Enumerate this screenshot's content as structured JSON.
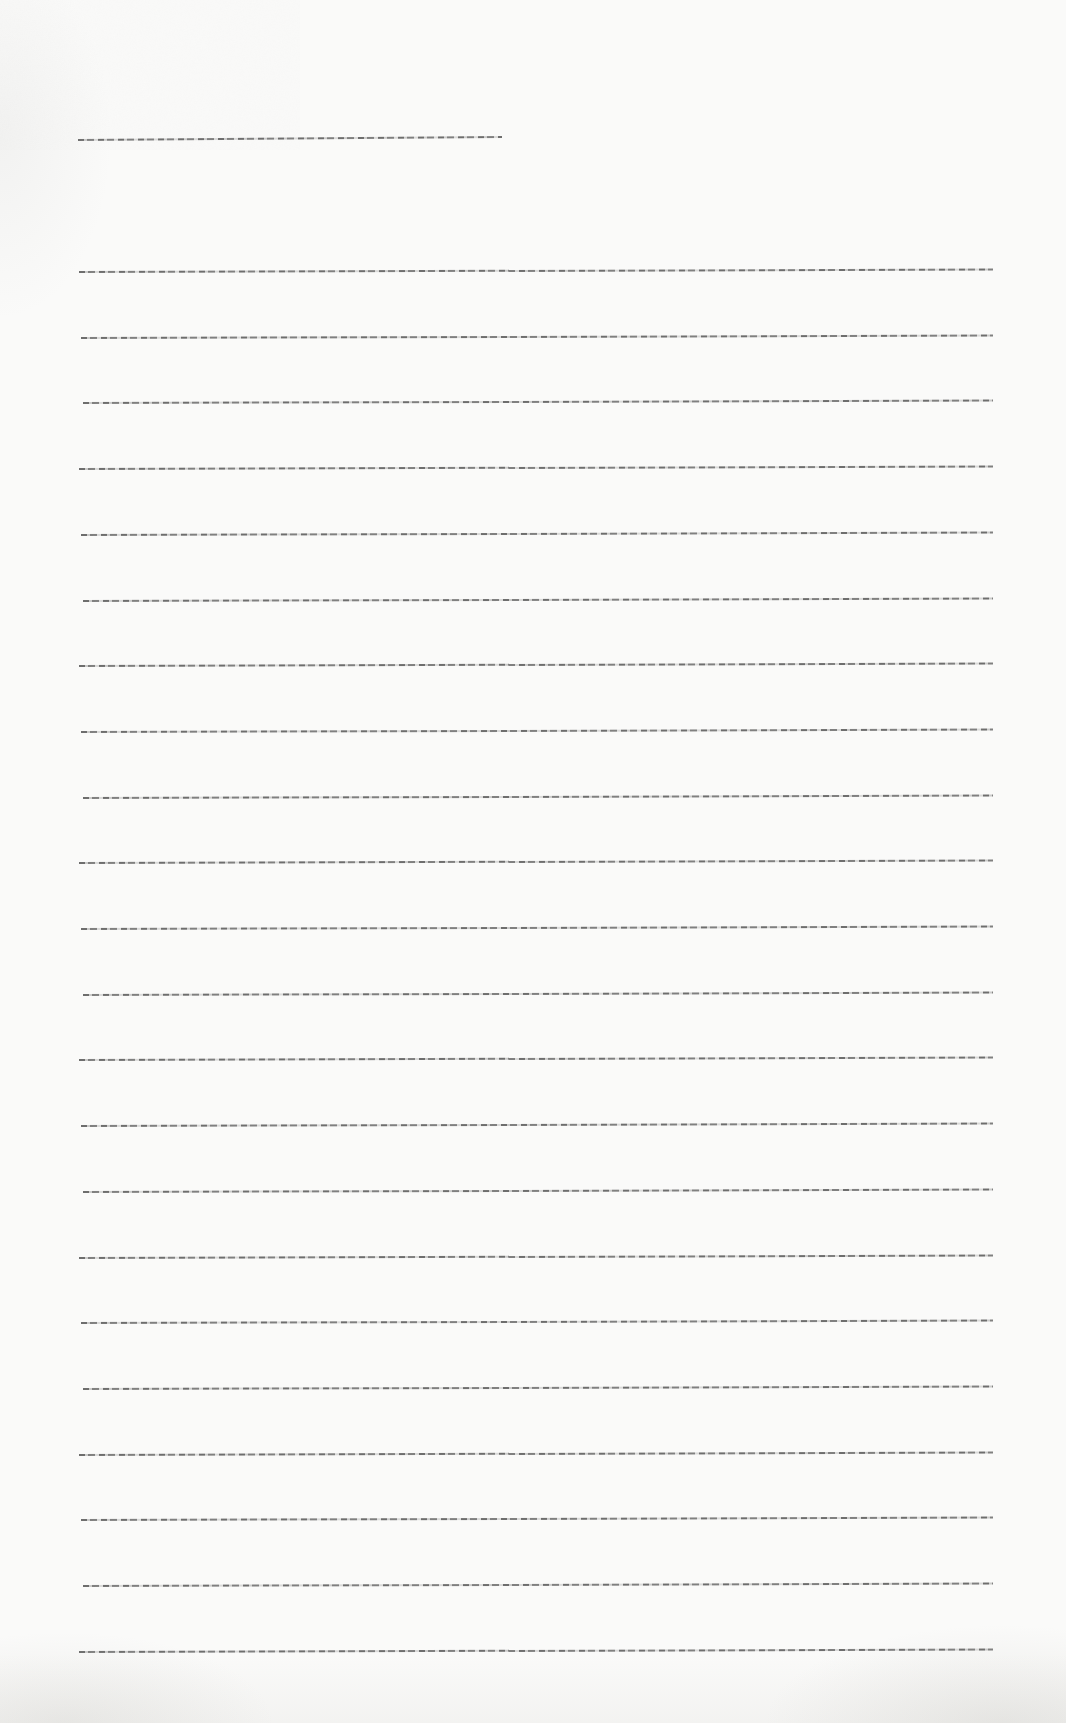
{
  "page": {
    "width": 1066,
    "height": 1723,
    "background_color": "#fafaf9",
    "content": "blank-ruled-notebook-page",
    "text_content": ""
  },
  "title_line": {
    "x": 78,
    "y": 139,
    "width": 424,
    "tilt_deg": -0.4
  },
  "ruled_lines": {
    "count": 22,
    "x": 79,
    "width": 914,
    "first_y": 271,
    "spacing": 65.7,
    "tilt_deg": -0.15
  },
  "colors": {
    "rule_dark": "#464646",
    "rule_light": "#8c8c8c",
    "paper": "#fafaf9",
    "noise": "#6e6c66"
  }
}
